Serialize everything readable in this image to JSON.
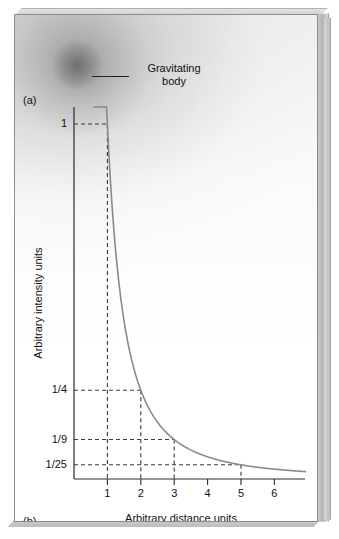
{
  "figure": {
    "panel_a_label": "(a)",
    "panel_b_label": "(b)",
    "annotation_label": "Gravitating\nbody",
    "annotation_icon": "leader-line-icon"
  },
  "colors": {
    "curve": "#8a8a8a",
    "axis": "#2b2b2b",
    "guide": "#3a3a3a",
    "frame": "#8c8c8c",
    "slab": "#c2c2c2",
    "text": "#111111"
  },
  "chart_data": {
    "type": "line",
    "title": "",
    "subtitle": "",
    "xlabel": "Arbitrary distance units",
    "ylabel": "Arbitrary intensity units",
    "annotations": [
      "Gravitating body"
    ],
    "grid": false,
    "legend": null,
    "xlim": [
      0,
      6.9
    ],
    "ylim": [
      0,
      1.12
    ],
    "xticks": [
      1,
      2,
      3,
      4,
      5,
      6
    ],
    "xticklabels": [
      "1",
      "2",
      "3",
      "4",
      "5",
      "6"
    ],
    "yticks": [
      0.04,
      0.1111,
      0.25,
      1.0
    ],
    "yticklabels": [
      "1/25",
      "1/9",
      "1/4",
      "1"
    ],
    "series": [
      {
        "name": "Inverse square law",
        "formula": "y = 1 / x^2",
        "x": [
          1,
          2,
          3,
          4,
          5,
          6
        ],
        "values": [
          1,
          0.25,
          0.1111,
          0.0625,
          0.04,
          0.0278
        ]
      }
    ],
    "guide_points": [
      {
        "x": 1,
        "y": 1,
        "ylabel": "1"
      },
      {
        "x": 2,
        "y": 0.25,
        "ylabel": "1/4"
      },
      {
        "x": 3,
        "y": 0.1111,
        "ylabel": "1/9"
      },
      {
        "x": 5,
        "y": 0.04,
        "ylabel": "1/25"
      }
    ]
  }
}
